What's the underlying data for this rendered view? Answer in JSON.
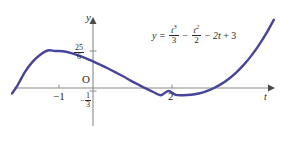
{
  "figure": {
    "background_color": "#ffffff",
    "curve_color": "#46459b",
    "axis_color": "#8a8a8a",
    "text_color": "#2b2b2b",
    "axis_label_y": "y",
    "axis_label_t": "t",
    "origin_label": "O",
    "equation": {
      "lhs": "y",
      "equals": "=",
      "term1_num": "t",
      "term1_pow": "3",
      "term1_den": "3",
      "op1": "−",
      "term2_num": "t",
      "term2_pow": "2",
      "term2_den": "2",
      "op2": "−",
      "term3": "2t",
      "op3": "+",
      "term4": "3"
    },
    "ticks": {
      "x": [
        {
          "label": "−1",
          "value": -1
        },
        {
          "label": "2",
          "value": 2
        }
      ],
      "y": [
        {
          "label_num": "25",
          "label_den": "6",
          "value": 4.1667
        },
        {
          "label_minus": "−",
          "label_num": "1",
          "label_den": "3",
          "value": -0.3333
        }
      ]
    }
  },
  "chart_data": {
    "type": "line",
    "title": "",
    "xlabel": "t",
    "ylabel": "y",
    "expression": "y = t^3/3 - t^2/2 - 2t + 3",
    "xlim": [
      -2.15,
      4.85
    ],
    "ylim": [
      -1.8,
      8.0
    ],
    "grid": false,
    "legend": null,
    "xticks": [
      -1,
      2
    ],
    "xticklabels": [
      "−1",
      "2"
    ],
    "yticks": [
      4.1667,
      -0.3333
    ],
    "yticklabels": [
      "25/6",
      "−1/3"
    ],
    "annotations": [
      {
        "text": "y = t³/3 − t²/2 − 2t + 3",
        "x": 2.1,
        "y": 7.0
      }
    ],
    "features": {
      "local_maximum": {
        "x": -1,
        "y": 4.1667
      },
      "local_minimum": {
        "x": 2,
        "y": -0.3333
      }
    },
    "series": [
      {
        "name": "y(t)",
        "color": "#46459b",
        "x": [
          -2.15,
          -2.0,
          -1.8,
          -1.6,
          -1.4,
          -1.2,
          -1.0,
          -0.8,
          -0.6,
          -0.4,
          -0.2,
          0.0,
          0.2,
          0.4,
          0.6,
          0.8,
          1.0,
          1.2,
          1.4,
          1.6,
          1.8,
          2.0,
          2.2,
          2.4,
          2.6,
          2.8,
          3.0,
          3.2,
          3.4,
          3.6,
          3.8,
          4.0,
          4.2,
          4.4,
          4.6,
          4.8
        ],
        "y": [
          -0.62,
          0.333,
          1.848,
          2.971,
          3.749,
          4.224,
          4.1667,
          4.139,
          3.952,
          3.675,
          3.367,
          3.0,
          2.609,
          2.195,
          1.762,
          1.317,
          0.8333,
          0.392,
          -0.043,
          -0.451,
          -0.816,
          -0.3333,
          -0.776,
          -0.808,
          -0.757,
          -0.616,
          -0.375,
          -0.027,
          0.435,
          1.021,
          1.741,
          2.6,
          3.617,
          4.797,
          6.149,
          7.68
        ]
      }
    ]
  }
}
